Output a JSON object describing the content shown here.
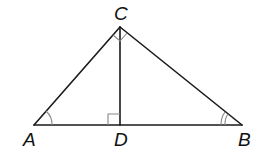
{
  "diagram": {
    "type": "geometry",
    "vertices": {
      "A": {
        "label": "A",
        "x": 34,
        "y": 125
      },
      "B": {
        "label": "B",
        "x": 242,
        "y": 125
      },
      "C": {
        "label": "C",
        "x": 120,
        "y": 27
      },
      "D": {
        "label": "D",
        "x": 120,
        "y": 125
      }
    },
    "segments": [
      "AC",
      "CB",
      "AB",
      "CD"
    ],
    "angle_marks": [
      {
        "vertex": "A",
        "type": "single-arc"
      },
      {
        "vertex": "B",
        "type": "double-arc"
      },
      {
        "vertex": "C",
        "type": "right-angle"
      },
      {
        "vertex": "D",
        "type": "right-angle"
      }
    ],
    "colors": {
      "line": "#1a1a1a",
      "mark": "#888888",
      "background": "#ffffff"
    }
  }
}
